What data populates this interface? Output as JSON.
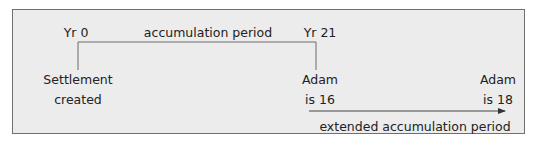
{
  "diagram": {
    "labels": {
      "start_year": "Yr 0",
      "period": "accumulation period",
      "end_year": "Yr 21",
      "start_event_line1": "Settlement",
      "start_event_line2": "created",
      "mid_event_line1": "Adam",
      "mid_event_line2": "is 16",
      "end_event_line1": "Adam",
      "end_event_line2": "is 18",
      "extended_period": "extended accumulation period"
    },
    "colors": {
      "background": "#ececec",
      "border": "#6f6f6f",
      "line": "#555555",
      "text": "#222222"
    }
  }
}
